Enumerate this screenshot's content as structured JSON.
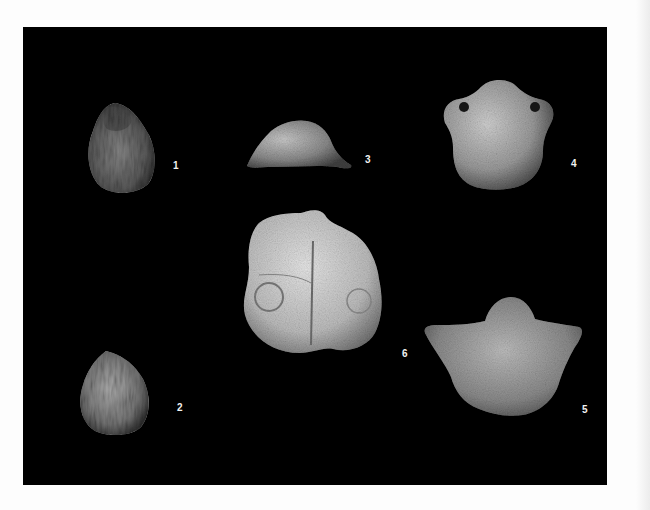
{
  "figure": {
    "background_color": "#000000",
    "page_color": "#fdfdfd",
    "specimens": [
      {
        "label": "1",
        "description": "small ovate ribbed shell, dorsal view"
      },
      {
        "label": "2",
        "description": "small ovate ribbed shell, pointed beak"
      },
      {
        "label": "3",
        "description": "shell in lateral/posterior view"
      },
      {
        "label": "4",
        "description": "smooth shell with rounded beak, dorsal view"
      },
      {
        "label": "5",
        "description": "alate shell with extended hinge, dorsal view"
      },
      {
        "label": "6",
        "description": "large shell interior/internal mould with median septum"
      }
    ]
  }
}
